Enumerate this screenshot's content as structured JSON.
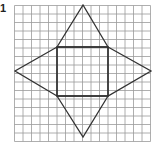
{
  "label": "1",
  "grid": {
    "x0": 14.5,
    "y0": 5.5,
    "cell": 8.5,
    "cols": 16,
    "rows": 16,
    "color": "#9a9a9a"
  },
  "shape": {
    "name": "square pyramid net",
    "stroke": "#333333",
    "square": [
      [
        57,
        47
      ],
      [
        108,
        47
      ],
      [
        108,
        96
      ],
      [
        57,
        96
      ]
    ],
    "triangles": [
      [
        [
          57,
          47
        ],
        [
          83,
          5
        ],
        [
          108,
          47
        ]
      ],
      [
        [
          108,
          47
        ],
        [
          151,
          71
        ],
        [
          108,
          96
        ]
      ],
      [
        [
          108,
          96
        ],
        [
          83,
          137
        ],
        [
          57,
          96
        ]
      ],
      [
        [
          57,
          96
        ],
        [
          15,
          71
        ],
        [
          57,
          47
        ]
      ]
    ]
  }
}
